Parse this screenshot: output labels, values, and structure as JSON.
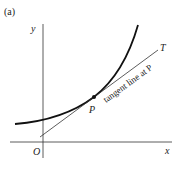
{
  "figure": {
    "panel_label": "(a)",
    "y_axis_label": "y",
    "x_axis_label": "x",
    "origin_label": "O",
    "point_label": "P",
    "tangent_end_label": "T",
    "tangent_caption": "tangent line at P",
    "colors": {
      "stroke": "#111111",
      "text": "#222222",
      "background": "#ffffff"
    }
  }
}
